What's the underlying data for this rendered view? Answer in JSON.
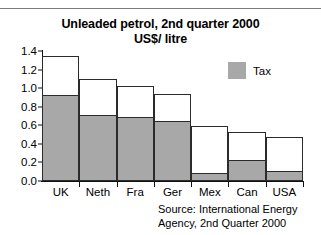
{
  "chart_data": {
    "type": "bar",
    "stacked": true,
    "title": "Unleaded petrol, 2nd quarter 2000",
    "subtitle": "US$/ litre",
    "xlabel": "",
    "ylabel": "",
    "ylim": [
      0.0,
      1.4
    ],
    "yticks": [
      "1.4",
      "1.2",
      "1.0",
      "0.8",
      "0.6",
      "0.4",
      "0.2",
      "0.0"
    ],
    "ytick_values": [
      1.4,
      1.2,
      1.0,
      0.8,
      0.6,
      0.4,
      0.2,
      0.0
    ],
    "grid": false,
    "categories": [
      "UK",
      "Neth",
      "Fra",
      "Ger",
      "Mex",
      "Can",
      "USA"
    ],
    "series": [
      {
        "name": "Tax",
        "color": "#a8a8a8",
        "values": [
          0.92,
          0.7,
          0.675,
          0.64,
          0.08,
          0.215,
          0.1
        ]
      },
      {
        "name": "Pre-tax price",
        "color": "#ffffff",
        "values": [
          0.43,
          0.4,
          0.345,
          0.3,
          0.51,
          0.31,
          0.37
        ]
      }
    ],
    "totals": [
      1.35,
      1.1,
      1.02,
      0.94,
      0.59,
      0.525,
      0.47
    ],
    "legend": {
      "position": "top-right",
      "entries": [
        {
          "label": "Tax",
          "color": "#a8a8a8"
        }
      ]
    },
    "source_note": [
      "Source: International Energy",
      "Agency, 2nd Quarter 2000"
    ]
  },
  "colors": {
    "tax_fill": "#a8a8a8",
    "bar_outline": "#2b2b2b",
    "axis": "#111111",
    "background": "#ffffff"
  }
}
